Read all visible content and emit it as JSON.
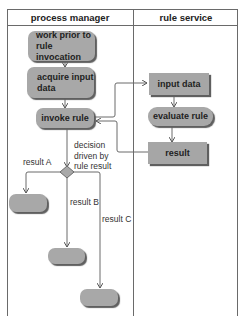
{
  "lanes": [
    {
      "title": "process manager"
    },
    {
      "title": "rule service"
    }
  ],
  "process_manager": {
    "nodes": [
      {
        "label": "work prior to rule invocation",
        "line1": "work prior to",
        "line2": "rule invocation"
      },
      {
        "label": "acquire input data",
        "line1": "acquire input",
        "line2": "data"
      },
      {
        "label": "invoke rule"
      }
    ],
    "decision_label": {
      "line1": "decision",
      "line2": "driven by",
      "line3": "rule result"
    },
    "outcomes": [
      {
        "label": "result A"
      },
      {
        "label": "result B"
      },
      {
        "label": "result C"
      }
    ]
  },
  "rule_service": {
    "nodes": [
      {
        "label": "input data"
      },
      {
        "label": "evaluate rule"
      },
      {
        "label": "result"
      }
    ]
  },
  "colors": {
    "node_fill": "#a8a8a8",
    "line": "#6a6a6a",
    "shadow": "#5f5f5f"
  }
}
